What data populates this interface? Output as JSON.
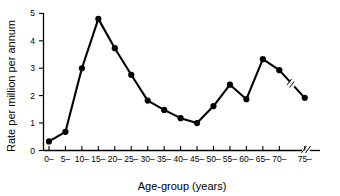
{
  "chart_data": {
    "type": "line",
    "title": "",
    "xlabel": "Age-group (years)",
    "ylabel": "Rate per million per annum",
    "categories": [
      "0–",
      "5–",
      "10–",
      "15–",
      "20–",
      "25–",
      "30–",
      "35–",
      "40–",
      "45–",
      "50–",
      "55–",
      "60–",
      "65–",
      "70–",
      "75–"
    ],
    "values": [
      0.33,
      0.68,
      3.0,
      4.8,
      3.73,
      2.76,
      1.82,
      1.48,
      1.18,
      1.0,
      1.62,
      2.4,
      1.87,
      3.33,
      2.93,
      1.92
    ],
    "ylim": [
      0,
      5
    ],
    "yticks": [
      0,
      1,
      2,
      3,
      4,
      5
    ],
    "ytick_labels": [
      "0",
      "1",
      "2",
      "3",
      "4",
      "5"
    ],
    "grid": false,
    "legend": null,
    "marker": "filled-circle",
    "line_color": "#000000",
    "marker_color": "#000000",
    "axis_break": {
      "between": [
        "70–",
        "75–"
      ],
      "style": "double-slash",
      "on_axis": true,
      "on_line": true
    }
  },
  "axis": {
    "x_title": "Age-group (years)",
    "y_title": "Rate per million per annum"
  }
}
